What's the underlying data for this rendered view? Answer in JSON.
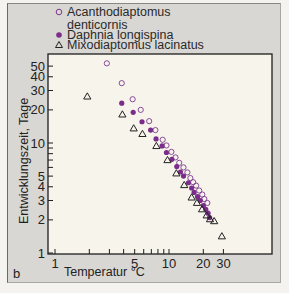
{
  "chart_data": {
    "type": "scatter",
    "title": "",
    "panel_label": "b",
    "xlabel": "Temperatur °C",
    "ylabel": "Entwicklungszeit, Tage",
    "xscale": "log",
    "yscale": "log",
    "xlim": [
      1,
      50
    ],
    "ylim": [
      1,
      60
    ],
    "x_ticks": [
      1,
      2,
      3,
      4,
      5,
      6,
      7,
      8,
      9,
      10,
      20,
      30
    ],
    "x_tick_labels": [
      "1",
      "5",
      "10",
      "20",
      "30"
    ],
    "x_tick_label_values": [
      1,
      5,
      10,
      20,
      30
    ],
    "y_ticks": [
      1,
      2,
      3,
      4,
      5,
      6,
      7,
      8,
      9,
      10,
      20,
      30,
      40,
      50
    ],
    "y_tick_labels": [
      "1",
      "2",
      "3",
      "4",
      "5",
      "10",
      "20",
      "30",
      "40",
      "50"
    ],
    "y_tick_label_values": [
      1,
      2,
      3,
      4,
      5,
      10,
      20,
      30,
      40,
      50
    ],
    "grid": false,
    "legend_position": "top-left, above plot",
    "series": [
      {
        "name": "Acanthodiaptomus denticornis",
        "legend_lines": [
          "Acanthodiaptomus",
          "denticornis"
        ],
        "marker": "open-circle",
        "color": "#7b3a8c",
        "x": [
          2.85,
          3.85,
          4.8,
          5.65,
          6.7,
          7.6,
          8.8,
          9.5,
          10.5,
          11.4,
          12.3,
          13.4,
          14.5,
          15.4,
          16.3,
          17.3,
          18.4,
          19.6,
          20.4,
          21.7
        ],
        "y": [
          53,
          35,
          25,
          20,
          15.8,
          13.1,
          10.7,
          9.5,
          8.3,
          7.4,
          6.6,
          6.0,
          5.4,
          4.8,
          4.4,
          4.1,
          3.7,
          3.4,
          3.1,
          2.85
        ]
      },
      {
        "name": "Daphnia longispina",
        "legend_lines": [
          "Daphnia longispina"
        ],
        "marker": "filled-circle",
        "color": "#7a2d8a",
        "x": [
          3.85,
          4.85,
          5.8,
          6.9,
          7.7,
          8.7,
          9.5,
          10.6,
          11.7,
          12.6,
          13.4,
          14.8,
          15.8,
          16.6,
          17.8,
          18.8,
          20.0,
          21.0,
          22.0,
          22.7
        ],
        "y": [
          23,
          19,
          15.6,
          13.1,
          10.9,
          9.4,
          8.2,
          7.1,
          6.1,
          5.45,
          5.0,
          4.35,
          3.9,
          3.55,
          3.25,
          3.0,
          2.7,
          2.5,
          2.3,
          2.1
        ]
      },
      {
        "name": "Mixodiaptomus lacinatus",
        "legend_lines": [
          "Mixodiaptomus lacinatus"
        ],
        "marker": "open-triangle",
        "color": "#222222",
        "x": [
          1.92,
          3.9,
          4.9,
          5.85,
          7.75,
          9.7,
          11.6,
          13.6,
          15.8,
          17.6,
          19.5,
          21.4,
          22.9,
          24.9,
          29.1
        ],
        "y": [
          26.5,
          18.2,
          13.6,
          12.1,
          9.4,
          7.0,
          5.3,
          4.15,
          3.2,
          2.86,
          2.5,
          2.2,
          2.03,
          1.95,
          1.42
        ]
      }
    ]
  },
  "colors": {
    "panel_background": "#d9d7d3",
    "plot_background": "#f7f4ec",
    "page_background": "#f4f3f0",
    "accent_purple": "#7a2d8a",
    "axis": "#1e1e1e"
  },
  "layout": {
    "plot_left": 48,
    "plot_top": 54,
    "plot_right": 272,
    "plot_bottom": 254,
    "x_origin_px": 55,
    "x_decade_px": 114,
    "y_origin_px": 253,
    "y_decade_px": 110
  }
}
